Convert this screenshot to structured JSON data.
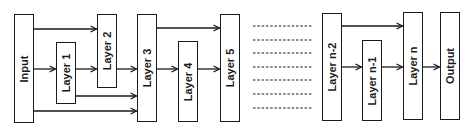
{
  "diagram": {
    "title": "",
    "type": "dense-skip-connection-network",
    "nodes": [
      {
        "id": "input",
        "label": "Input",
        "x": 14,
        "y": 14,
        "w": 20,
        "h": 109
      },
      {
        "id": "layer1",
        "label": "Layer 1",
        "x": 56,
        "y": 42,
        "w": 20,
        "h": 62
      },
      {
        "id": "layer2",
        "label": "Layer 2",
        "x": 97,
        "y": 14,
        "w": 20,
        "h": 74
      },
      {
        "id": "layer3",
        "label": "Layer 3",
        "x": 137,
        "y": 14,
        "w": 20,
        "h": 108
      },
      {
        "id": "layer4",
        "label": "Layer 4",
        "x": 178,
        "y": 41,
        "w": 20,
        "h": 81
      },
      {
        "id": "layer5",
        "label": "Layer 5",
        "x": 220,
        "y": 14,
        "w": 20,
        "h": 108
      },
      {
        "id": "layern2",
        "label": "Layer n-2",
        "x": 322,
        "y": 13,
        "w": 20,
        "h": 108
      },
      {
        "id": "layern1",
        "label": "Layer n-1",
        "x": 362,
        "y": 40,
        "w": 20,
        "h": 81
      },
      {
        "id": "layern",
        "label": "Layer n",
        "x": 403,
        "y": 12,
        "w": 20,
        "h": 108
      },
      {
        "id": "output",
        "label": "Output",
        "x": 440,
        "y": 12,
        "w": 20,
        "h": 108
      }
    ],
    "edges": [
      {
        "from": "input",
        "to": "layer2",
        "y": 29
      },
      {
        "from": "input",
        "to": "layer1",
        "y": 69
      },
      {
        "from": "input",
        "to": "layer3",
        "y": 111
      },
      {
        "from": "layer1",
        "to": "layer2",
        "y": 69
      },
      {
        "from": "layer1",
        "to": "layer3",
        "y": 96
      },
      {
        "from": "layer2",
        "to": "layer3",
        "y": 69
      },
      {
        "from": "layer3",
        "to": "layer5",
        "y": 28
      },
      {
        "from": "layer3",
        "to": "layer4",
        "y": 69
      },
      {
        "from": "layer4",
        "to": "layer5",
        "y": 69
      },
      {
        "from": "layern2",
        "to": "layern",
        "y": 26
      },
      {
        "from": "layern2",
        "to": "layern1",
        "y": 67
      },
      {
        "from": "layern1",
        "to": "layern",
        "y": 67
      },
      {
        "from": "layern",
        "to": "output",
        "y": 67
      }
    ],
    "ellipsis_lines": {
      "count": 7,
      "x1": 253,
      "x2": 313,
      "y_positions": [
        26,
        40,
        53,
        67,
        80,
        94,
        108
      ],
      "style": "dashed"
    },
    "colors": {
      "stroke": "#1a1a1a",
      "background": "#ffffff"
    }
  }
}
